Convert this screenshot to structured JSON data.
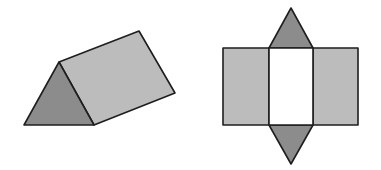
{
  "figure": {
    "colors": {
      "lateral_face": "#bcbcbc",
      "triangular_face": "#8c8c8c",
      "highlighted_face": "#ffffff",
      "edge": "#1e1e1e",
      "background": "#ffffff"
    },
    "prism": {
      "label": "triangular prism (3D view)",
      "faces": [
        "front triangular face",
        "slanted lateral face"
      ]
    },
    "net": {
      "label": "net of triangular prism",
      "rectangles": [
        "left lateral face",
        "middle lateral face",
        "right lateral face"
      ],
      "triangles": [
        "top base triangle",
        "bottom base triangle"
      ]
    }
  }
}
